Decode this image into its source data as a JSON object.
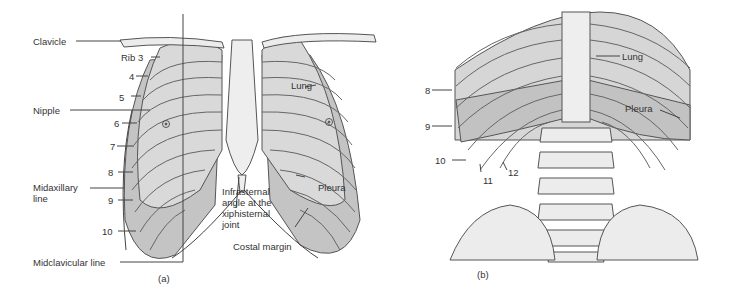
{
  "figure_a": {
    "caption": "(a)",
    "labels": {
      "clavicle": "Clavicle",
      "rib3": "Rib 3",
      "rib4": "4",
      "rib5": "5",
      "nipple": "Nipple",
      "rib6": "6",
      "rib7": "7",
      "rib8": "8",
      "midaxillary": "Midaxillary line",
      "rib9": "9",
      "rib10": "10",
      "midclavicular": "Midclavicular line",
      "lung": "Lung",
      "pleura": "Pleura",
      "infrasternal": "Infrasternal angle at the xiphisternal joint",
      "costal_margin": "Costal margin"
    }
  },
  "figure_b": {
    "caption": "(b)",
    "labels": {
      "rib8": "8",
      "rib9": "9",
      "rib10": "10",
      "rib11": "11",
      "rib12": "12",
      "lung": "Lung",
      "pleura": "Pleura"
    }
  },
  "colors": {
    "bone": "#e6e6e6",
    "lung": "#d4d4d4",
    "pleura": "#bdbdbd",
    "line": "#555555"
  }
}
